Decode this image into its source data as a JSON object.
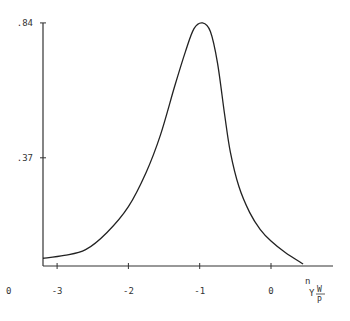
{
  "chart_data": {
    "type": "line",
    "title": "",
    "xlabel": "n γ W/P",
    "xlabel_parts": {
      "top": "n",
      "main": "Y",
      "num": "W",
      "den": "P"
    },
    "ylabel": "",
    "origin_label": "0",
    "xlim": [
      -3.2,
      0.9
    ],
    "ylim": [
      0,
      0.84
    ],
    "x_ticks": [
      -3,
      -2,
      -1,
      0
    ],
    "x_tick_labels": [
      "-3",
      "-2",
      "-1",
      "0"
    ],
    "y_ticks": [
      0.37,
      0.84
    ],
    "y_tick_labels": [
      ".37",
      ".84"
    ],
    "grid": false,
    "legend": "none",
    "series": [
      {
        "name": "density",
        "x": [
          -3.2,
          -2.9,
          -2.6,
          -2.3,
          -2.0,
          -1.75,
          -1.55,
          -1.35,
          -1.2,
          -1.08,
          -0.96,
          -0.85,
          -0.75,
          -0.65,
          -0.57,
          -0.45,
          -0.3,
          -0.15,
          0.0,
          0.2,
          0.45
        ],
        "y": [
          0.02,
          0.03,
          0.05,
          0.11,
          0.2,
          0.32,
          0.45,
          0.62,
          0.74,
          0.82,
          0.84,
          0.81,
          0.7,
          0.52,
          0.39,
          0.27,
          0.18,
          0.12,
          0.08,
          0.04,
          0.0
        ]
      }
    ]
  }
}
